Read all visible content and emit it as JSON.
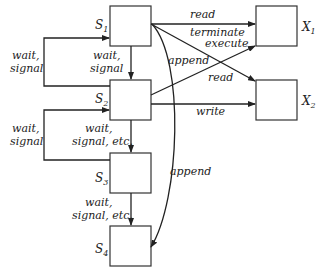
{
  "diagram": {
    "nodes": [
      {
        "id": "S1",
        "name": "S",
        "sub": "1",
        "x": 110,
        "y": 6,
        "w": 41,
        "h": 40
      },
      {
        "id": "S2",
        "name": "S",
        "sub": "2",
        "x": 110,
        "y": 80,
        "w": 41,
        "h": 40
      },
      {
        "id": "S3",
        "name": "S",
        "sub": "3",
        "x": 110,
        "y": 153,
        "w": 41,
        "h": 40
      },
      {
        "id": "S4",
        "name": "S",
        "sub": "4",
        "x": 110,
        "y": 226,
        "w": 41,
        "h": 40
      },
      {
        "id": "X1",
        "name": "X",
        "sub": "1",
        "x": 256,
        "y": 6,
        "w": 41,
        "h": 40
      },
      {
        "id": "X2",
        "name": "X",
        "sub": "2",
        "x": 256,
        "y": 80,
        "w": 41,
        "h": 40
      }
    ],
    "edges": [
      {
        "from": "S1",
        "to": "X1",
        "label": "read"
      },
      {
        "from": "S1",
        "to": "X2",
        "label": "terminate"
      },
      {
        "from": "S2",
        "to": "X1",
        "label": "execute"
      },
      {
        "from": "S2",
        "to": "X1",
        "label": "append"
      },
      {
        "from": "S1",
        "to": "X2",
        "label": "read"
      },
      {
        "from": "S2",
        "to": "X2",
        "label": "write"
      },
      {
        "from": "S1",
        "to": "S2",
        "label": "wait, signal"
      },
      {
        "from": "S2",
        "to": "S1",
        "label": "wait, signal"
      },
      {
        "from": "S2",
        "to": "S3",
        "label": "wait, signal, etc."
      },
      {
        "from": "S3",
        "to": "S2",
        "label": "wait, signal"
      },
      {
        "from": "S3",
        "to": "S4",
        "label": "wait, signal, etc."
      },
      {
        "from": "S1",
        "to": "S4",
        "label": "append"
      }
    ],
    "labels": {
      "read_top": "read",
      "terminate": "terminate",
      "execute": "execute",
      "append_mid": "append",
      "read_mid": "read",
      "write": "write",
      "wait_left_1a": "wait,",
      "wait_left_1b": "signal",
      "wait_center_1a": "wait,",
      "wait_center_1b": "signal",
      "wait_left_2a": "wait,",
      "wait_left_2b": "signal",
      "wait_center_2a": "wait,",
      "wait_center_2b": "signal, etc.",
      "wait_center_3a": "wait,",
      "wait_center_3b": "signal, etc.",
      "append_right": "append"
    }
  }
}
